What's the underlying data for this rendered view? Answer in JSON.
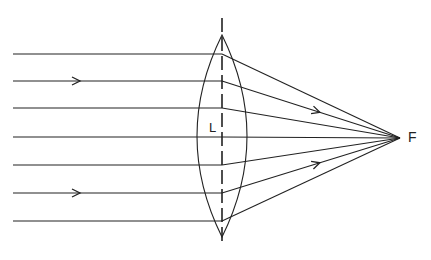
{
  "diagram": {
    "lens_label": "L",
    "focus_label": "F",
    "lens": {
      "x": 222,
      "top": 35,
      "bottom": 237,
      "axis_top": 18,
      "axis_bottom": 246,
      "half_width": 25
    },
    "focus": {
      "x": 400,
      "y": 138
    },
    "ray_start_x": 13,
    "rays_y": [
      54,
      81,
      108,
      137,
      165,
      193,
      221
    ],
    "incoming_arrows_on": [
      1,
      5
    ],
    "outgoing_arrows_on": [
      1,
      5
    ],
    "colors": {
      "line": "#222222",
      "background": "#ffffff"
    }
  }
}
